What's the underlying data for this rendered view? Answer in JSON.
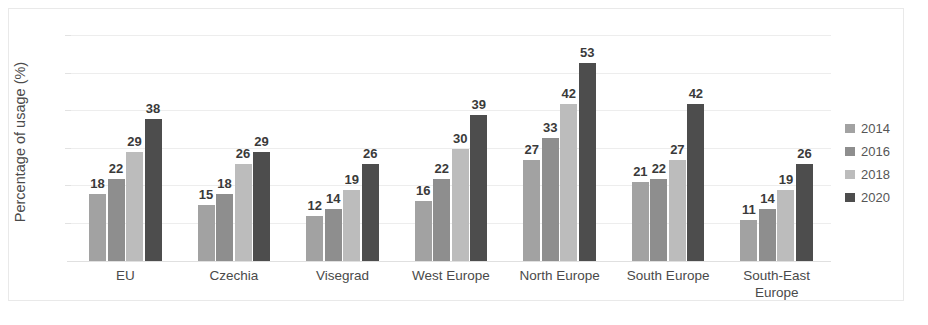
{
  "chart_data": {
    "type": "bar",
    "title": "",
    "subtitle": "",
    "xlabel": "",
    "ylabel": "Percentage of usage (%)",
    "ylim": [
      0,
      62
    ],
    "grid": true,
    "grid_values": [
      10,
      20,
      30,
      40,
      50,
      60
    ],
    "legend_position": "right",
    "categories": [
      "EU",
      "Czechia",
      "Visegrad",
      "West Europe",
      "North Europe",
      "South Europe",
      "South-East\nEurope"
    ],
    "series": [
      {
        "name": "2014",
        "color": "#a2a2a2",
        "values": [
          18,
          15,
          12,
          16,
          27,
          21,
          11
        ]
      },
      {
        "name": "2016",
        "color": "#8e8e8e",
        "values": [
          22,
          18,
          14,
          22,
          33,
          22,
          14
        ]
      },
      {
        "name": "2018",
        "color": "#bcbcbc",
        "values": [
          29,
          26,
          19,
          30,
          42,
          27,
          19
        ]
      },
      {
        "name": "2020",
        "color": "#4d4d4d",
        "values": [
          38,
          29,
          26,
          39,
          53,
          42,
          26
        ]
      }
    ]
  },
  "legend": {
    "items": [
      {
        "label": "2014",
        "color": "#a2a2a2"
      },
      {
        "label": "2016",
        "color": "#8e8e8e"
      },
      {
        "label": "2018",
        "color": "#bcbcbc"
      },
      {
        "label": "2020",
        "color": "#4d4d4d"
      }
    ]
  },
  "axis": {
    "y_title": "Percentage of usage (%)"
  },
  "colors": {
    "gridline": "#ededed",
    "frame": "#e9e9e9",
    "label_text": "#3a3a3a",
    "category_text": "#4a4a4a"
  }
}
